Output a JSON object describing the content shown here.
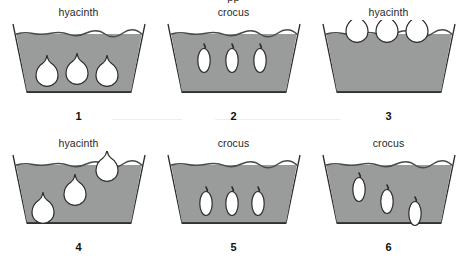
{
  "figure": {
    "cut_off_title": "pp",
    "background_color": "#ffffff",
    "fill_color": "#9a9b9b",
    "outline_color": "#2b2b2b",
    "bulb_color": "#ffffff"
  },
  "panels": [
    {
      "number": "1",
      "label": "hyacinth",
      "bulb_type": "hyacinth",
      "bulb_count": 3,
      "bulbs": [
        {
          "x": 38,
          "y": 52,
          "scale": 1.0
        },
        {
          "x": 68,
          "y": 50,
          "scale": 1.0
        },
        {
          "x": 98,
          "y": 52,
          "scale": 1.0
        }
      ]
    },
    {
      "number": "2",
      "label": "crocus",
      "bulb_type": "crocus",
      "bulb_count": 3,
      "bulbs": [
        {
          "x": 40,
          "y": 40,
          "scale": 1.0
        },
        {
          "x": 68,
          "y": 40,
          "scale": 1.0
        },
        {
          "x": 96,
          "y": 40,
          "scale": 1.0
        }
      ]
    },
    {
      "number": "3",
      "label": "hyacinth",
      "bulb_type": "hyacinth",
      "bulb_count": 3,
      "bulbs": [
        {
          "x": 38,
          "y": 8,
          "scale": 1.0
        },
        {
          "x": 68,
          "y": 8,
          "scale": 1.0
        },
        {
          "x": 98,
          "y": 8,
          "scale": 1.0
        }
      ]
    },
    {
      "number": "4",
      "label": "hyacinth",
      "bulb_type": "hyacinth",
      "bulb_count": 3,
      "bulbs": [
        {
          "x": 34,
          "y": 58,
          "scale": 1.0
        },
        {
          "x": 66,
          "y": 40,
          "scale": 1.0
        },
        {
          "x": 98,
          "y": 16,
          "scale": 1.0
        }
      ]
    },
    {
      "number": "5",
      "label": "crocus",
      "bulb_type": "crocus",
      "bulb_count": 3,
      "bulbs": [
        {
          "x": 42,
          "y": 52,
          "scale": 1.0
        },
        {
          "x": 68,
          "y": 52,
          "scale": 1.0
        },
        {
          "x": 94,
          "y": 52,
          "scale": 1.0
        }
      ]
    },
    {
      "number": "6",
      "label": "crocus",
      "bulb_type": "crocus",
      "bulb_count": 3,
      "bulbs": [
        {
          "x": 40,
          "y": 38,
          "scale": 1.0
        },
        {
          "x": 68,
          "y": 50,
          "scale": 1.0
        },
        {
          "x": 96,
          "y": 62,
          "scale": 1.0
        }
      ]
    }
  ]
}
